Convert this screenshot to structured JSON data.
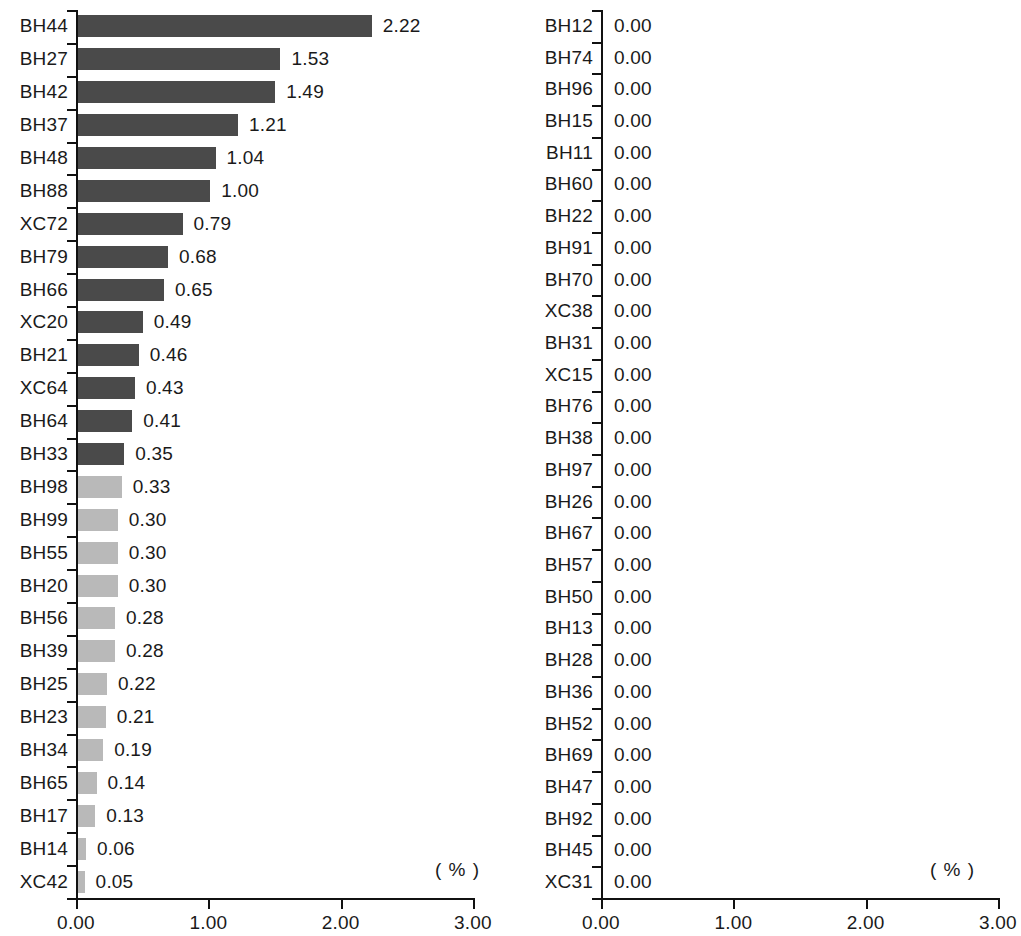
{
  "chart_data": [
    {
      "type": "bar",
      "orientation": "horizontal",
      "panel": "left",
      "title": "",
      "xlabel": "( % )",
      "ylabel": "",
      "unit_label": "( % )",
      "xlim": [
        0,
        3
      ],
      "xticks": [
        0,
        1,
        2,
        3
      ],
      "xtick_labels": [
        "0.00",
        "1.00",
        "2.00",
        "3.00"
      ],
      "grid": false,
      "legend": "none",
      "value_format": "0.00",
      "categories": [
        "BH44",
        "BH27",
        "BH42",
        "BH37",
        "BH48",
        "BH88",
        "XC72",
        "BH79",
        "BH66",
        "XC20",
        "BH21",
        "XC64",
        "BH64",
        "BH33",
        "BH98",
        "BH99",
        "BH55",
        "BH20",
        "BH56",
        "BH39",
        "BH25",
        "BH23",
        "BH34",
        "BH65",
        "BH17",
        "BH14",
        "XC42"
      ],
      "values": [
        2.22,
        1.53,
        1.49,
        1.21,
        1.04,
        1.0,
        0.79,
        0.68,
        0.65,
        0.49,
        0.46,
        0.43,
        0.41,
        0.35,
        0.33,
        0.3,
        0.3,
        0.3,
        0.28,
        0.28,
        0.22,
        0.21,
        0.19,
        0.14,
        0.13,
        0.06,
        0.05
      ],
      "value_labels": [
        "2.22",
        "1.53",
        "1.49",
        "1.21",
        "1.04",
        "1.00",
        "0.79",
        "0.68",
        "0.65",
        "0.49",
        "0.46",
        "0.43",
        "0.41",
        "0.35",
        "0.33",
        "0.30",
        "0.30",
        "0.30",
        "0.28",
        "0.28",
        "0.22",
        "0.21",
        "0.19",
        "0.14",
        "0.13",
        "0.06",
        "0.05"
      ],
      "bar_colors": [
        "dark",
        "dark",
        "dark",
        "dark",
        "dark",
        "dark",
        "dark",
        "dark",
        "dark",
        "dark",
        "dark",
        "dark",
        "dark",
        "dark",
        "light",
        "light",
        "light",
        "light",
        "light",
        "light",
        "light",
        "light",
        "light",
        "light",
        "light",
        "light",
        "light"
      ]
    },
    {
      "type": "bar",
      "orientation": "horizontal",
      "panel": "right",
      "title": "",
      "xlabel": "( % )",
      "ylabel": "",
      "unit_label": "( % )",
      "xlim": [
        0,
        3
      ],
      "xticks": [
        0,
        1,
        2,
        3
      ],
      "xtick_labels": [
        "0.00",
        "1.00",
        "2.00",
        "3.00"
      ],
      "grid": false,
      "legend": "none",
      "value_format": "0.00",
      "categories": [
        "BH12",
        "BH74",
        "BH96",
        "BH15",
        "BH11",
        "BH60",
        "BH22",
        "BH91",
        "BH70",
        "XC38",
        "BH31",
        "XC15",
        "BH76",
        "BH38",
        "BH97",
        "BH26",
        "BH67",
        "BH57",
        "BH50",
        "BH13",
        "BH28",
        "BH36",
        "BH52",
        "BH69",
        "BH47",
        "BH92",
        "BH45",
        "XC31"
      ],
      "values": [
        0,
        0,
        0,
        0,
        0,
        0,
        0,
        0,
        0,
        0,
        0,
        0,
        0,
        0,
        0,
        0,
        0,
        0,
        0,
        0,
        0,
        0,
        0,
        0,
        0,
        0,
        0,
        0
      ],
      "value_labels": [
        "0.00",
        "0.00",
        "0.00",
        "0.00",
        "0.00",
        "0.00",
        "0.00",
        "0.00",
        "0.00",
        "0.00",
        "0.00",
        "0.00",
        "0.00",
        "0.00",
        "0.00",
        "0.00",
        "0.00",
        "0.00",
        "0.00",
        "0.00",
        "0.00",
        "0.00",
        "0.00",
        "0.00",
        "0.00",
        "0.00",
        "0.00",
        "0.00"
      ],
      "bar_colors": [
        "light",
        "light",
        "light",
        "light",
        "light",
        "light",
        "light",
        "light",
        "light",
        "light",
        "light",
        "light",
        "light",
        "light",
        "light",
        "light",
        "light",
        "light",
        "light",
        "light",
        "light",
        "light",
        "light",
        "light",
        "light",
        "light",
        "light",
        "light"
      ]
    }
  ],
  "colors": {
    "bar_dark": "#4a4a4a",
    "bar_light": "#b9b9b9",
    "axis": "#111111",
    "text": "#1a1a1a",
    "background": "#ffffff"
  }
}
